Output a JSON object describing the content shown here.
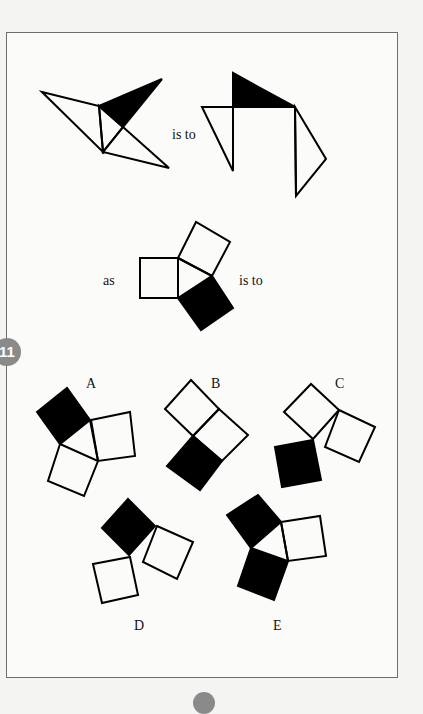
{
  "question": {
    "number": "11",
    "connectors": {
      "is_to_1": "is to",
      "as": "as",
      "is_to_2": "is to"
    },
    "options": [
      {
        "letter": "A"
      },
      {
        "letter": "B"
      },
      {
        "letter": "C"
      },
      {
        "letter": "D"
      },
      {
        "letter": "E"
      }
    ]
  },
  "colors": {
    "frame_border": "#6e6e6e",
    "badge": "#8a8a8a",
    "fill": "#000000",
    "background": "#fbfbfa"
  }
}
